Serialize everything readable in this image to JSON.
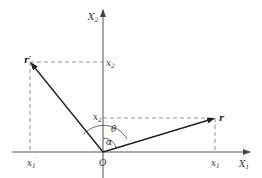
{
  "diagram": {
    "type": "coordinate-rotation",
    "axes": {
      "horizontal": {
        "label": "X",
        "subscript": "1"
      },
      "vertical": {
        "label": "X",
        "subscript": "2"
      }
    },
    "origin_label": "O",
    "vectors": [
      {
        "name": "r",
        "label": "r",
        "prime": ""
      },
      {
        "name": "r-prime",
        "label": "r",
        "prime": "′"
      }
    ],
    "component_labels": {
      "x1": {
        "label": "x",
        "subscript": "1",
        "prime": ""
      },
      "x2": {
        "label": "x",
        "subscript": "2",
        "prime": ""
      },
      "x1_prime": {
        "label": "x",
        "subscript": "1",
        "prime": "′"
      },
      "x2_prime": {
        "label": "x",
        "subscript": "2",
        "prime": "′"
      }
    },
    "angles": {
      "theta": "θ",
      "alpha": "α"
    },
    "colors": {
      "axis": "#555555",
      "vector": "#222222",
      "dashed": "#777777"
    }
  }
}
